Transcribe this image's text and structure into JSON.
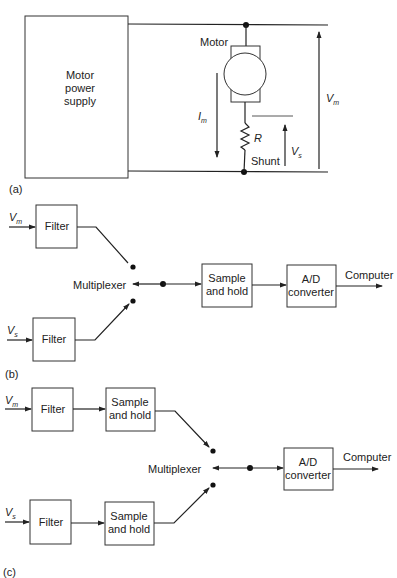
{
  "panel_a": {
    "tag": "(a)",
    "supply_lines": [
      "Motor",
      "power",
      "supply"
    ],
    "motor_label": "Motor",
    "current_label": "I",
    "current_sub": "m",
    "resistor_label": "R",
    "shunt_label": "Shunt",
    "vs_label": "V",
    "vs_sub": "s",
    "vm_label": "V",
    "vm_sub": "m"
  },
  "panel_b": {
    "tag": "(b)",
    "input_top": "V",
    "input_top_sub": "m",
    "input_bottom": "V",
    "input_bottom_sub": "s",
    "filter_top": "Filter",
    "filter_bottom": "Filter",
    "multiplexer": "Multiplexer",
    "sample_hold": [
      "Sample",
      "and hold"
    ],
    "adc": [
      "A/D",
      "converter"
    ],
    "output": "Computer"
  },
  "panel_c": {
    "tag": "(c)",
    "input_top": "V",
    "input_top_sub": "m",
    "input_bottom": "V",
    "input_bottom_sub": "s",
    "filter_top": "Filter",
    "filter_bottom": "Filter",
    "sh_top": [
      "Sample",
      "and hold"
    ],
    "sh_bottom": [
      "Sample",
      "and hold"
    ],
    "multiplexer": "Multiplexer",
    "adc": [
      "A/D",
      "converter"
    ],
    "output": "Computer"
  }
}
